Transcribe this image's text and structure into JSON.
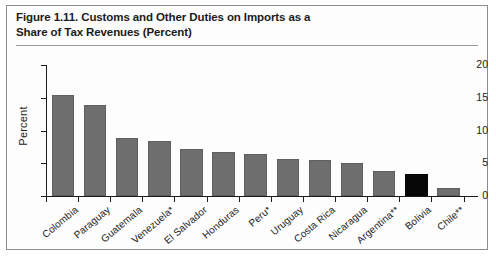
{
  "figure": {
    "title_line1": "Figure 1.11. Customs and Other Duties on Imports as a",
    "title_line2": "Share of Tax Revenues (Percent)"
  },
  "chart_data": {
    "type": "bar",
    "title": "Figure 1.11. Customs and Other Duties on Imports as a Share of Tax Revenues (Percent)",
    "xlabel": "",
    "ylabel": "Percent",
    "ylim": [
      0,
      20
    ],
    "yticks": [
      0,
      5,
      10,
      15,
      20
    ],
    "ytick_labels": [
      "0",
      "5",
      "10",
      "15",
      "20"
    ],
    "grid": false,
    "legend": "none",
    "categories": [
      "Colombia",
      "Paraguay",
      "Guatemala",
      "Venezuela*",
      "El Salvador",
      "Honduras",
      "Peru*",
      "Uruguay",
      "Costa Rica",
      "Nicaragua",
      "Argentina**",
      "Bolivia",
      "Chile**"
    ],
    "values": [
      15.4,
      13.9,
      8.8,
      8.4,
      7.2,
      6.7,
      6.4,
      5.7,
      5.5,
      5.0,
      3.8,
      3.4,
      1.3
    ],
    "bar_colors": [
      "#6e6e6e",
      "#6e6e6e",
      "#6e6e6e",
      "#6e6e6e",
      "#6e6e6e",
      "#6e6e6e",
      "#6e6e6e",
      "#6e6e6e",
      "#6e6e6e",
      "#6e6e6e",
      "#6e6e6e",
      "#070707",
      "#6e6e6e"
    ],
    "highlight_category": "Bolivia",
    "highlight_color": "#070707",
    "default_color": "#6e6e6e"
  }
}
